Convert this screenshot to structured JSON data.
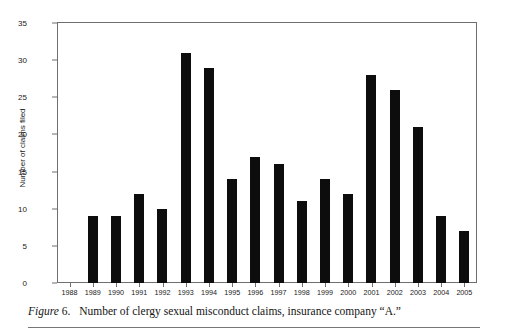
{
  "chart_data": {
    "type": "bar",
    "title": "",
    "xlabel": "",
    "ylabel": "Number of claims filed",
    "categories": [
      "1988",
      "1989",
      "1990",
      "1991",
      "1992",
      "1993",
      "1994",
      "1995",
      "1996",
      "1997",
      "1998",
      "1999",
      "2000",
      "2001",
      "2002",
      "2003",
      "2004",
      "2005"
    ],
    "values": [
      0,
      9,
      9,
      12,
      10,
      31,
      29,
      14,
      17,
      16,
      11,
      14,
      12,
      28,
      26,
      21,
      9,
      7
    ],
    "ylim": [
      0,
      35
    ],
    "ytick_labels": [
      "0",
      "5",
      "10",
      "15",
      "20",
      "25",
      "30",
      "35"
    ],
    "ytick_values": [
      0,
      5,
      10,
      15,
      20,
      25,
      30,
      35
    ],
    "grid": false,
    "legend": null,
    "bar_color": "#0d0d0d",
    "frame_color": "#6f6f6f"
  },
  "caption": {
    "figure_label": "Figure",
    "figure_number": "6.",
    "text": "Number of clergy sexual misconduct claims, insurance company “A.”"
  }
}
